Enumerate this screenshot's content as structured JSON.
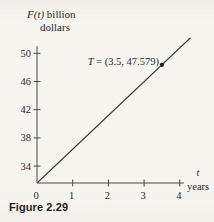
{
  "figure": {
    "caption": "Figure 2.29"
  },
  "chart_data": {
    "type": "line",
    "title": "",
    "ylabel": "F(t) billion dollars",
    "ylabel_parts": {
      "func": "F(t)",
      "rest": " billion",
      "line2": "dollars"
    },
    "xlabel": "t years",
    "xlabel_parts": {
      "var": "t",
      "unit": "years"
    },
    "x_ticks": [
      "0",
      "1",
      "2",
      "3",
      "4"
    ],
    "y_ticks": [
      "34",
      "38",
      "42",
      "46",
      "50"
    ],
    "x_range": [
      0,
      4
    ],
    "y_axis_bottom": 31.6,
    "y_axis_top": 51,
    "grid": false,
    "legend": false,
    "series": [
      {
        "name": "F(t)",
        "shape": "straight line from axis origin",
        "points": [
          [
            0,
            31.6
          ],
          [
            4.3,
            52.2
          ]
        ]
      }
    ],
    "annotation": {
      "t": 3.5,
      "value": 47.579,
      "label": "T = (3.5, 47.579)",
      "label_var": "T",
      "label_rest": " = (3.5, 47.579)"
    },
    "colors": {
      "paper": "#f5f4ef",
      "ink": "#2b2b2b",
      "axis": "#4a4a4a",
      "line": "#3f3f3f",
      "point": "#1c1c1c"
    }
  }
}
